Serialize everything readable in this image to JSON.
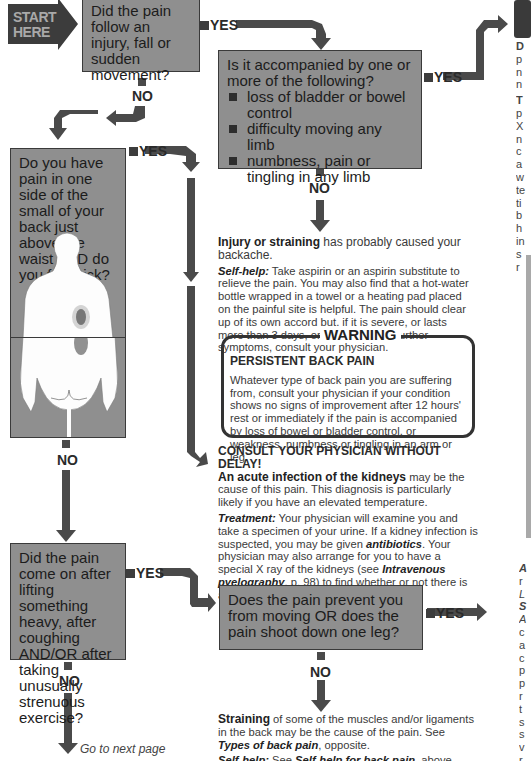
{
  "start": {
    "label_line1": "START",
    "label_line2": "HERE"
  },
  "connectors": {
    "yes": "YES",
    "no": "NO"
  },
  "q1": {
    "text": "Did the pain follow an injury, fall or sudden movement?"
  },
  "q2": {
    "text": "Is it accompanied by one or more of the following?",
    "items": [
      "loss of bladder or bowel control",
      "difficulty moving any limb",
      "numbness, pain or tingling in any limb"
    ]
  },
  "q3": {
    "text": "Do you have pain in one side of the small of your back just above the waist AND do you feel sick?"
  },
  "q4": {
    "text": "Did the pain come on after lifting something heavy, after coughing AND/OR after taking unusually strenuous exercise?"
  },
  "q5": {
    "text": "Does the pain prevent you from moving OR does the pain shoot down one leg?"
  },
  "injury": {
    "bold": "Injury or straining",
    "rest": " has probably caused your backache.",
    "selfhelp_label": "Self-help:",
    "selfhelp_text": " Take aspirin or an aspirin substitute to relieve the pain. You may also find that a hot-water bottle wrapped in a towel or a heating pad placed on the painful site is helpful. The pain should clear up of its own accord but, if it is severe, or lasts more than 3 days, or if you develop further symptoms, consult your physician."
  },
  "warning": {
    "title": "WARNING",
    "heading": "PERSISTENT BACK PAIN",
    "text": "Whatever type of back pain you are suffering from, consult your physician if your condition shows no signs of improvement after 12 hours' rest or immediately if the pain is accompanied by loss of bowel or bladder control, or weakness, numbness or tingling in an arm or leg."
  },
  "kidney": {
    "heading": "CONSULT YOUR PHYSICIAN WITHOUT DELAY!",
    "bold": "An acute infection of the kidneys",
    "rest": " may be the cause of this pain. This diagnosis is particularly likely if you have an elevated temperature.",
    "treatment_label": "Treatment:",
    "treatment_a": " Your physician will examine you and take a specimen of your urine. If a kidney infection is suspected, you may be given ",
    "antibiotics": "antibiotics",
    "treatment_b": ". Your physician may also arrange for you to have a special X ray of the kidneys (see ",
    "ivp": "Intravenous pyelography",
    "treatment_c": ", p. 98) to find whether or not there is an underlying cause of the problem."
  },
  "straining": {
    "bold": "Straining",
    "rest": " of some of the muscles and/or ligaments in the back may be the cause of the pain. See ",
    "link": "Types of back pain",
    "rest2": ", opposite.",
    "selfhelp_label": "Self-help:",
    "selfhelp_a": " See ",
    "selfhelp_link": "Self-help for back pain",
    "selfhelp_b": ", above right."
  },
  "next_page": "Go to next page",
  "right_edge_top": [
    "D",
    "p",
    "n",
    "n",
    "T",
    "p",
    "X",
    "n",
    "c",
    "a",
    "w",
    "te",
    "ti",
    "b",
    "h",
    "in",
    "s",
    "r"
  ],
  "right_edge_bottom": [
    "A",
    "r",
    "L",
    "S",
    "A",
    "c",
    "a",
    "c",
    "p",
    "p",
    "r",
    "t",
    "s",
    "s",
    "v",
    "r"
  ],
  "colors": {
    "box_fill": "#8f8f8f",
    "arrow": "#4a4a4a",
    "start_fill": "#3c3c3c",
    "sidebar_fill": "#a9a9a9"
  }
}
